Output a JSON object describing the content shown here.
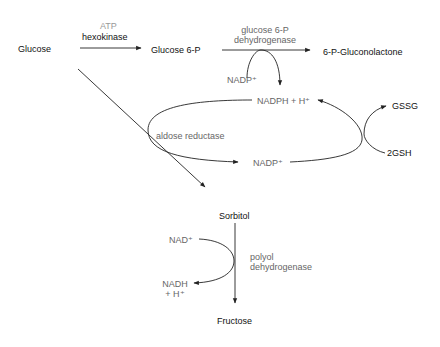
{
  "nodes": {
    "glucose": "Glucose",
    "glucose6p": "Glucose 6-P",
    "gluconolactone": "6-P-Gluconolactone",
    "sorbitol": "Sorbitol",
    "fructose": "Fructose",
    "gssg": "GSSG",
    "gsh": "2GSH"
  },
  "cofactors": {
    "atp": "ATP",
    "nadp_top": "NADP⁺",
    "nadph": "NADPH + H⁺",
    "nadp_loop": "NADP⁺",
    "nad": "NAD⁺",
    "nadh_line1": "NADH",
    "nadh_line2": "+ H⁺"
  },
  "enzymes": {
    "hexokinase": "hexokinase",
    "g6pd_line1": "glucose 6-P",
    "g6pd_line2": "dehydrogenase",
    "aldose_reductase": "aldose reductase",
    "polyol_line1": "polyol",
    "polyol_line2": "dehydrogenase"
  },
  "colors": {
    "line": "#222222",
    "enzyme_gray": "#666666",
    "atp_gray": "#999999"
  }
}
